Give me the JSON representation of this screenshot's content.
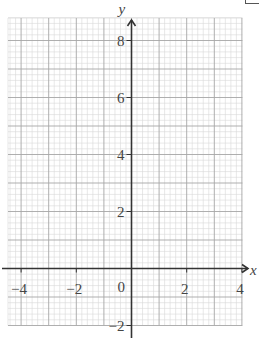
{
  "diagram": {
    "type": "coordinate-grid",
    "x_axis": {
      "label": "x",
      "min": -4.4,
      "max": 4,
      "ticks": [
        {
          "value": -4,
          "label": "−4"
        },
        {
          "value": -2,
          "label": "−2"
        },
        {
          "value": 2,
          "label": "2"
        },
        {
          "value": 4,
          "label": "4"
        }
      ]
    },
    "y_axis": {
      "label": "y",
      "min": -2,
      "max": 8.8,
      "ticks": [
        {
          "value": 8,
          "label": "8"
        },
        {
          "value": 6,
          "label": "6"
        },
        {
          "value": 4,
          "label": "4"
        },
        {
          "value": 2,
          "label": "2"
        },
        {
          "value": -2,
          "label": "−2"
        }
      ]
    },
    "origin_label": "0",
    "grid": {
      "minor_step": 0.2,
      "medium_step": 1,
      "major_step": 2
    },
    "colors": {
      "minor_grid": "#d9d9d9",
      "major_grid": "#a6a6a6",
      "axis": "#333333",
      "text": "#444444"
    }
  }
}
